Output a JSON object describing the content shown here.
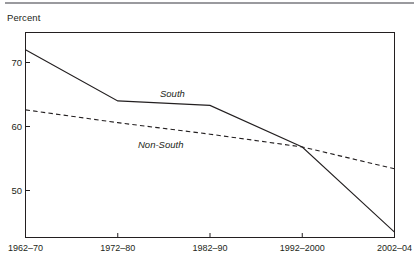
{
  "chart_data": {
    "type": "line",
    "title": "",
    "ylabel": "Percent",
    "xlabel": "",
    "categories": [
      "1962–70",
      "1972–80",
      "1982–90",
      "1992–2000",
      "2002–04"
    ],
    "yticks": [
      50,
      60,
      70
    ],
    "ylim": [
      41,
      75
    ],
    "grid": false,
    "legend_position": "inline",
    "series": [
      {
        "name": "South",
        "style": "solid",
        "color": "#231f20",
        "values": [
          72.0,
          64.0,
          63.3,
          56.8,
          43.5
        ]
      },
      {
        "name": "Non-South",
        "style": "dashed",
        "color": "#231f20",
        "values": [
          62.6,
          60.6,
          58.8,
          56.8,
          53.4
        ]
      }
    ],
    "annotations": [
      {
        "text": "South",
        "series": "South",
        "x_px": 160,
        "y_px": 95
      },
      {
        "text": "Non-South",
        "series": "Non-South",
        "x_px": 138,
        "y_px": 146
      }
    ]
  },
  "ytick_labels": [
    "70",
    "60",
    "50"
  ],
  "xtick_labels": [
    "1962–70",
    "1972–80",
    "1982–90",
    "1992–2000",
    "2002–04"
  ],
  "series_labels": {
    "south": "South",
    "non_south": "Non-South"
  },
  "colors": {
    "line": "#231f20",
    "axis": "#231f20",
    "rule": "#9a9a9e",
    "background": "#ffffff"
  }
}
